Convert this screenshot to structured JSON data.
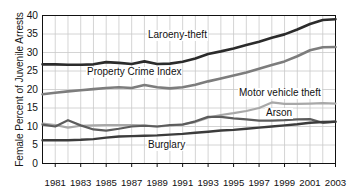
{
  "chart_data": {
    "type": "line",
    "title": "",
    "xlabel": "",
    "ylabel": "Female Percent of Juvenile Arrests",
    "xlim": [
      1980,
      2003
    ],
    "ylim": [
      0,
      40
    ],
    "grid": true,
    "legend_position": "inline-annotations",
    "ytick_labels": [
      "0",
      "5",
      "10",
      "15",
      "20",
      "25",
      "30",
      "35",
      "40"
    ],
    "ytick_values": [
      0,
      5,
      10,
      15,
      20,
      25,
      30,
      35,
      40
    ],
    "xtick_labels": [
      "1981",
      "1983",
      "1985",
      "1987",
      "1989",
      "1991",
      "1993",
      "1995",
      "1997",
      "1999",
      "2001",
      "2003"
    ],
    "xtick_values": [
      1981,
      1983,
      1985,
      1987,
      1989,
      1991,
      1993,
      1995,
      1997,
      1999,
      2001,
      2003
    ],
    "x": [
      1980,
      1981,
      1982,
      1983,
      1984,
      1985,
      1986,
      1987,
      1988,
      1989,
      1990,
      1991,
      1992,
      1993,
      1994,
      1995,
      1996,
      1997,
      1998,
      1999,
      2000,
      2001,
      2002,
      2003
    ],
    "series": [
      {
        "name": "Laroeny-theft",
        "color": "#2b2b2b",
        "width": 2.6,
        "values": [
          26.8,
          26.8,
          26.7,
          26.7,
          26.8,
          27.4,
          27.2,
          26.9,
          27.6,
          26.9,
          27.0,
          27.5,
          28.4,
          29.6,
          30.3,
          31.1,
          32.0,
          32.9,
          34.0,
          34.9,
          36.2,
          37.7,
          38.8,
          39.0
        ]
      },
      {
        "name": "Property Crime Index",
        "color": "#7d7d7d",
        "width": 2.6,
        "values": [
          18.7,
          19.1,
          19.5,
          19.8,
          20.1,
          20.4,
          20.6,
          20.4,
          21.2,
          20.6,
          20.3,
          20.6,
          21.3,
          22.2,
          23.0,
          23.8,
          24.6,
          25.6,
          26.6,
          27.6,
          29.0,
          30.6,
          31.4,
          31.5
        ]
      },
      {
        "name": "Motor vehicle theft",
        "color": "#a8a8a8",
        "width": 2.2,
        "values": [
          10.8,
          10.4,
          9.7,
          10.2,
          10.3,
          10.4,
          10.4,
          10.4,
          10.3,
          10.0,
          10.2,
          10.6,
          11.2,
          12.4,
          13.1,
          13.6,
          14.2,
          15.0,
          16.5,
          16.1,
          16.1,
          16.2,
          16.3,
          16.2
        ]
      },
      {
        "name": "Arson",
        "color": "#5c5c5c",
        "width": 2.2,
        "values": [
          10.5,
          10.0,
          11.7,
          10.3,
          9.2,
          8.9,
          9.4,
          10.0,
          10.2,
          10.0,
          10.4,
          10.5,
          11.4,
          12.6,
          12.6,
          12.2,
          11.9,
          11.6,
          11.6,
          11.7,
          11.9,
          12.0,
          11.0,
          11.3
        ]
      },
      {
        "name": "Burglary",
        "color": "#3c3c3c",
        "width": 2.4,
        "values": [
          6.3,
          6.3,
          6.3,
          6.4,
          6.6,
          7.0,
          7.3,
          7.4,
          7.5,
          7.6,
          7.8,
          8.0,
          8.3,
          8.6,
          8.9,
          9.1,
          9.4,
          9.7,
          10.0,
          10.3,
          10.6,
          11.0,
          11.2,
          11.3
        ]
      }
    ],
    "annotations": [
      {
        "text": "Laroeny-theft",
        "name": "larceny-theft-label"
      },
      {
        "text": "Property Crime Index",
        "name": "property-crime-index-label"
      },
      {
        "text": "Motor vehicle theft",
        "name": "motor-vehicle-theft-label"
      },
      {
        "text": "Arson",
        "name": "arson-label"
      },
      {
        "text": "Burglary",
        "name": "burglary-label"
      }
    ]
  }
}
